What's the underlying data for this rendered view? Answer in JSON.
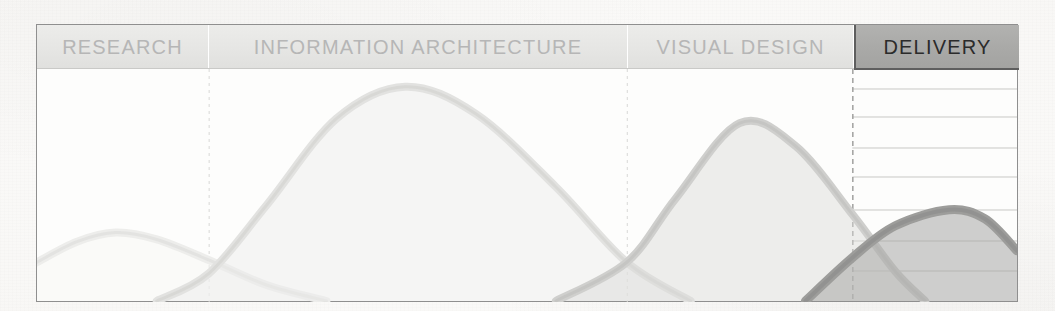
{
  "figure": {
    "frame": {
      "x": 36,
      "y": 24,
      "width": 982,
      "height": 278
    }
  },
  "header": {
    "cells": [
      {
        "label": "RESEARCH",
        "style": "light",
        "x": 0,
        "width": 172
      },
      {
        "label": "INFORMATION ARCHITECTURE",
        "style": "light",
        "x": 172,
        "width": 419
      },
      {
        "label": "VISUAL DESIGN",
        "style": "light",
        "x": 591,
        "width": 226
      },
      {
        "label": "DELIVERY",
        "style": "dark",
        "x": 817,
        "width": 165
      }
    ]
  },
  "colors": {
    "paper": "#fbfaf8",
    "frame_border": "#8f8f8f",
    "header_light_fill": "#e8e8e6",
    "header_light_text": "#b6b6b6",
    "header_dark_fill": "#a9a9a7",
    "header_dark_text": "#2b2b2b",
    "header_dark_border": "#5e5e5e",
    "gridline": "#c8c8c6",
    "divider_dashed": "#d8d8d6",
    "curve_research": "#ededeb",
    "curve_information_architecture": "#e2e2e0",
    "curve_visual_design": "#cfcfcd",
    "curve_delivery": "#9d9d9b"
  },
  "chart_data": {
    "type": "area",
    "xlabel": "",
    "ylabel": "",
    "grid": "horizontal gridlines shown only inside the DELIVERY column",
    "legend": "none",
    "xlim": [
      0,
      982
    ],
    "ylim": [
      0,
      1
    ],
    "phase_boundaries_px": [
      172,
      591,
      817
    ],
    "gridlines_y_px": [
      20,
      48,
      79,
      108,
      141,
      172,
      202
    ],
    "series": [
      {
        "name": "RESEARCH",
        "color": "#ededeb",
        "peak_x_px": 79,
        "peak_value": 0.3,
        "start_x_px": 0,
        "end_x_px": 300,
        "points": [
          {
            "x": 0,
            "y": 0.17
          },
          {
            "x": 40,
            "y": 0.26
          },
          {
            "x": 79,
            "y": 0.3
          },
          {
            "x": 120,
            "y": 0.27
          },
          {
            "x": 172,
            "y": 0.18
          },
          {
            "x": 230,
            "y": 0.07
          },
          {
            "x": 290,
            "y": 0.0
          }
        ]
      },
      {
        "name": "INFORMATION ARCHITECTURE",
        "color": "#e2e2e0",
        "peak_x_px": 369,
        "peak_value": 0.94,
        "start_x_px": 120,
        "end_x_px": 660,
        "points": [
          {
            "x": 120,
            "y": 0.0
          },
          {
            "x": 172,
            "y": 0.12
          },
          {
            "x": 230,
            "y": 0.42
          },
          {
            "x": 300,
            "y": 0.8
          },
          {
            "x": 369,
            "y": 0.94
          },
          {
            "x": 440,
            "y": 0.82
          },
          {
            "x": 520,
            "y": 0.5
          },
          {
            "x": 591,
            "y": 0.17
          },
          {
            "x": 655,
            "y": 0.0
          }
        ]
      },
      {
        "name": "VISUAL DESIGN",
        "color": "#cfcfcd",
        "peak_x_px": 704,
        "peak_value": 0.78,
        "start_x_px": 520,
        "end_x_px": 900,
        "points": [
          {
            "x": 520,
            "y": 0.0
          },
          {
            "x": 591,
            "y": 0.17
          },
          {
            "x": 640,
            "y": 0.45
          },
          {
            "x": 704,
            "y": 0.78
          },
          {
            "x": 760,
            "y": 0.68
          },
          {
            "x": 817,
            "y": 0.38
          },
          {
            "x": 860,
            "y": 0.13
          },
          {
            "x": 890,
            "y": 0.0
          }
        ]
      },
      {
        "name": "DELIVERY",
        "color": "#9d9d9b",
        "peak_x_px": 914,
        "peak_value": 0.4,
        "start_x_px": 770,
        "end_x_px": 982,
        "points": [
          {
            "x": 770,
            "y": 0.0
          },
          {
            "x": 817,
            "y": 0.19
          },
          {
            "x": 860,
            "y": 0.33
          },
          {
            "x": 914,
            "y": 0.4
          },
          {
            "x": 950,
            "y": 0.36
          },
          {
            "x": 982,
            "y": 0.22
          }
        ]
      }
    ]
  }
}
